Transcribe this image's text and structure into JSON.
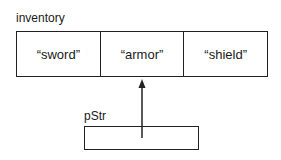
{
  "array": {
    "name": "inventory",
    "elements": [
      "“sword”",
      "“armor”",
      "“shield”"
    ]
  },
  "pointer": {
    "name": "pStr",
    "points_to_index": 1
  }
}
